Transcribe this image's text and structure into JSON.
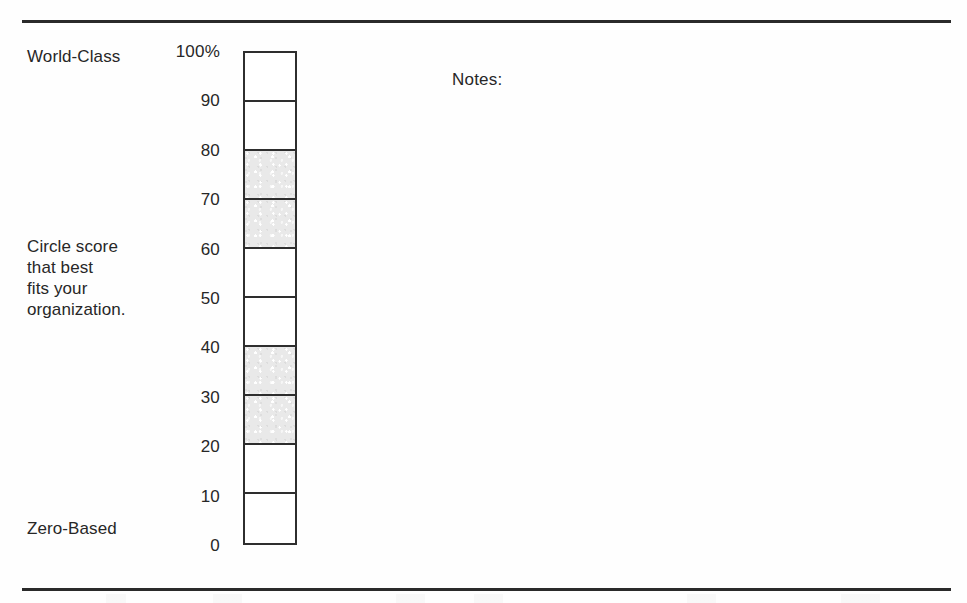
{
  "document": {
    "top_rule": "horizontal-rule",
    "bottom_rule": "horizontal-rule"
  },
  "labels": {
    "top_anchor": "World-Class",
    "instruction": "Circle score\nthat best\nfits your\norganization.",
    "bottom_anchor": "Zero-Based"
  },
  "notes": {
    "label": "Notes:",
    "value": ""
  },
  "scale": {
    "ticks": [
      "100%",
      "90",
      "80",
      "70",
      "60",
      "50",
      "40",
      "30",
      "20",
      "10",
      "0"
    ],
    "shaded_color": "#e9e9e9",
    "border_color": "#2e2e2e",
    "cells": [
      {
        "range": "90-100",
        "shaded": false
      },
      {
        "range": "80-90",
        "shaded": false
      },
      {
        "range": "70-80",
        "shaded": true
      },
      {
        "range": "60-70",
        "shaded": true
      },
      {
        "range": "50-60",
        "shaded": false
      },
      {
        "range": "40-50",
        "shaded": false
      },
      {
        "range": "30-40",
        "shaded": true
      },
      {
        "range": "20-30",
        "shaded": true
      },
      {
        "range": "10-20",
        "shaded": false
      },
      {
        "range": "0-10",
        "shaded": false
      }
    ]
  },
  "chart_data": {
    "type": "bar",
    "title": "",
    "xlabel": "",
    "ylabel": "",
    "ylim": [
      0,
      100
    ],
    "orientation": "vertical-scale",
    "categories": [
      "0-10",
      "10-20",
      "20-30",
      "30-40",
      "40-50",
      "50-60",
      "60-70",
      "70-80",
      "80-90",
      "90-100"
    ],
    "values": [
      0,
      0,
      1,
      1,
      0,
      0,
      1,
      1,
      0,
      0
    ],
    "tick_labels": [
      "0",
      "10",
      "20",
      "30",
      "40",
      "50",
      "60",
      "70",
      "80",
      "90",
      "100%"
    ],
    "annotations": [
      "World-Class",
      "Zero-Based",
      "Circle score that best fits your organization.",
      "Notes:"
    ],
    "grid": false,
    "legend": null
  }
}
